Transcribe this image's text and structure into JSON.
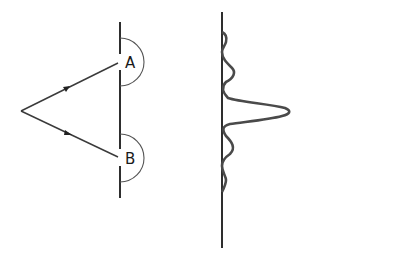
{
  "diagram": {
    "type": "double-slit interference",
    "slits": [
      {
        "label": "A",
        "x": 120,
        "y": 62
      },
      {
        "label": "B",
        "x": 120,
        "y": 158
      }
    ],
    "source": {
      "x": 21,
      "y": 111
    },
    "barrier": {
      "x": 120,
      "y_top": 22,
      "y_bottom": 198
    },
    "screen": {
      "x": 222,
      "y_top": 12,
      "y_bottom": 248
    },
    "intensity_pattern": {
      "description": "central bright maximum with diminishing side fringes",
      "central_peak_y": 111,
      "central_peak_x": 288,
      "side_fringes": [
        {
          "y": 74,
          "x": 233
        },
        {
          "y": 40,
          "x": 226
        },
        {
          "y": 148,
          "x": 233
        },
        {
          "y": 182,
          "x": 226
        }
      ]
    },
    "colors": {
      "line": "#3a3a3a",
      "background": "#ffffff"
    }
  }
}
